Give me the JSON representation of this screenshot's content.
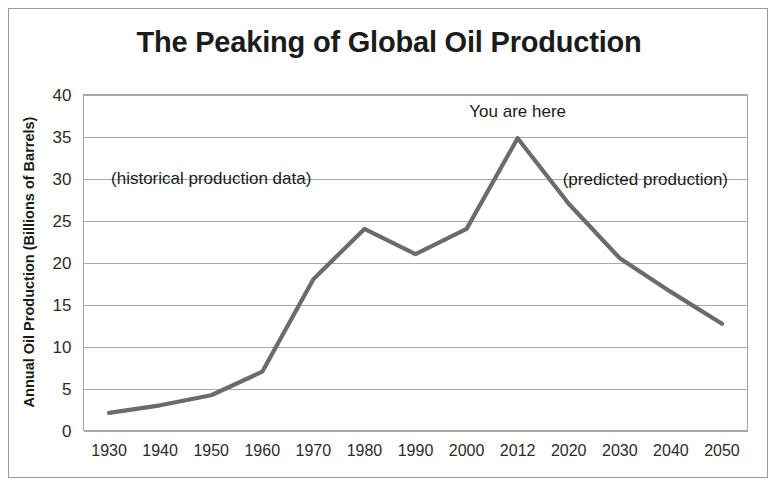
{
  "figure": {
    "title": "The Peaking of Global Oil Production",
    "frame_color": "#9a9a9a",
    "background": "#ffffff"
  },
  "chart_data": {
    "type": "line",
    "title": "The Peaking of Global Oil Production",
    "xlabel": "",
    "ylabel": "Annual Oil Production (Billions of Barrels)",
    "categories": [
      "1930",
      "1940",
      "1950",
      "1960",
      "1970",
      "1980",
      "1990",
      "2000",
      "2012",
      "2020",
      "2030",
      "2040",
      "2050"
    ],
    "values": [
      2.1,
      3.0,
      4.2,
      7.0,
      18.0,
      24.0,
      21.0,
      24.0,
      34.8,
      27.0,
      20.5,
      16.5,
      12.7
    ],
    "series": [
      {
        "name": "Annual Oil Production",
        "color": "#6b6b6b",
        "values": [
          2.1,
          3.0,
          4.2,
          7.0,
          18.0,
          24.0,
          21.0,
          24.0,
          34.8,
          27.0,
          20.5,
          16.5,
          12.7
        ]
      }
    ],
    "ylim": [
      0,
      40
    ],
    "ytick_labels": [
      "0",
      "5",
      "10",
      "15",
      "20",
      "25",
      "30",
      "35",
      "40"
    ],
    "ytick_values": [
      0,
      5,
      10,
      15,
      20,
      25,
      30,
      35,
      40
    ],
    "grid": true,
    "grid_color": "#a8a8a8",
    "legend": "none",
    "line_color": "#6b6b6b",
    "annotations": [
      {
        "name": "historical-label",
        "text": "(historical production data)",
        "x_value": "1950",
        "y_value": 29.4,
        "anchor": "middle"
      },
      {
        "name": "you-are-here-label",
        "text": "You are here",
        "x_value": "2012",
        "y_value": 37.3,
        "anchor": "middle"
      },
      {
        "name": "predicted-label",
        "text": "(predicted production)",
        "x_value": "2035",
        "y_value": 29.2,
        "anchor": "middle"
      }
    ]
  }
}
